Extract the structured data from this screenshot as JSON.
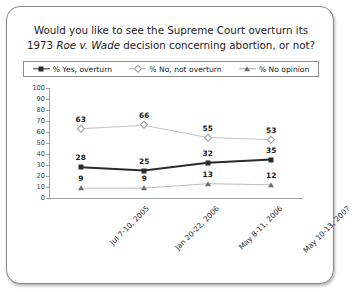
{
  "card": {
    "title_line1": "Would you like to see the Supreme Court overturn its",
    "title_line2_pre": "1973 ",
    "title_line2_italic": "Roe v. Wade",
    "title_line2_post": " decision concerning abortion, or not?"
  },
  "legend": {
    "items": [
      {
        "label": "% Yes, overturn",
        "marker": "square-marker",
        "color": "#2b2b2b"
      },
      {
        "label": "% No, not overturn",
        "marker": "diamond-marker",
        "color": "#b9b9b9"
      },
      {
        "label": "% No opinion",
        "marker": "triangle-marker",
        "color": "#8f8f8f"
      }
    ]
  },
  "chart_data": {
    "type": "line",
    "title": "Would you like to see the Supreme Court overturn its 1973 Roe v. Wade decision concerning abortion, or not?",
    "xlabel": "",
    "ylabel": "",
    "ylim": [
      0,
      100
    ],
    "yticks": [
      0,
      10,
      20,
      30,
      40,
      50,
      60,
      70,
      80,
      90,
      100
    ],
    "grid": false,
    "legend_position": "top",
    "categories": [
      "Jul 7-10, 2005",
      "Jan 20-22, 2006",
      "May 8-11, 2006",
      "May 10-13, 2007"
    ],
    "series": [
      {
        "name": "% Yes, overturn",
        "values": [
          28,
          25,
          32,
          35
        ],
        "marker": "square",
        "color": "#2b2b2b"
      },
      {
        "name": "% No, not overturn",
        "values": [
          63,
          66,
          55,
          53
        ],
        "marker": "diamond",
        "color": "#b9b9b9"
      },
      {
        "name": "% No opinion",
        "values": [
          9,
          9,
          13,
          12
        ],
        "marker": "triangle",
        "color": "#a8a8a8"
      }
    ]
  }
}
